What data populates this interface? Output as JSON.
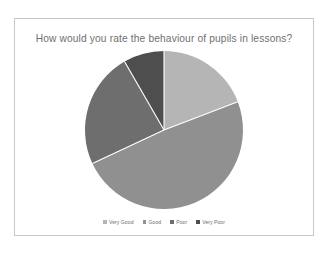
{
  "chart": {
    "title": "How would you rate the behaviour of pupils in lessons?",
    "title_color": "#6f6f6f",
    "frame_color": "#c8c8c8",
    "background": "#ffffff",
    "separator_color": "#ffffff"
  },
  "legend": {
    "position": "bottom",
    "items": [
      {
        "label": "Very Good",
        "color": "#b5b5b5"
      },
      {
        "label": "Good",
        "color": "#909090"
      },
      {
        "label": "Poor",
        "color": "#6e6e6e"
      },
      {
        "label": "Very Poor",
        "color": "#4e4e4e"
      }
    ]
  },
  "chart_data": {
    "type": "pie",
    "title": "How would you rate the behaviour of pupils in lessons?",
    "xlabel": "",
    "ylabel": "",
    "categories": [
      "Very Good",
      "Good",
      "Poor",
      "Very Poor"
    ],
    "values": [
      19,
      49,
      24,
      8
    ],
    "units": "percent",
    "colors": [
      "#b5b5b5",
      "#909090",
      "#6e6e6e",
      "#4e4e4e"
    ],
    "start_angle_deg": 0,
    "direction": "clockwise",
    "boundary_angles_deg": [
      0,
      69,
      245,
      330,
      360
    ],
    "center_px": [
      163,
      129
    ],
    "radius_px": 79,
    "legend_position": "bottom",
    "grid": false,
    "data_labels": false
  }
}
